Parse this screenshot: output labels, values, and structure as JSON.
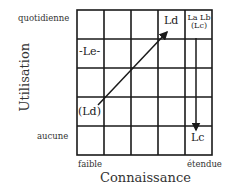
{
  "axes": {
    "y_label": "Utilisation",
    "x_label": "Connaissance",
    "y_top": "quotidienne",
    "y_bottom": "aucune",
    "x_left": "faible",
    "x_right": "étendue"
  },
  "grid": {
    "rows": 5,
    "cols": 5
  },
  "cells": {
    "ld": "Ld",
    "le": "-Le-",
    "ld_paren": "(Ld)",
    "lc": "Lc",
    "la_lb": "La Lb",
    "lc_paren": "(Lc)"
  },
  "arrows": [
    {
      "from": "(Ld)",
      "to": "Ld",
      "direction": "diagonal-up-right"
    },
    {
      "from": "La Lb (Lc)",
      "to": "Lc",
      "direction": "down"
    }
  ]
}
